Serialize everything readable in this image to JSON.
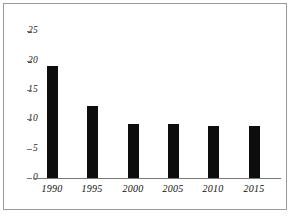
{
  "chart_data": {
    "type": "bar",
    "title": "",
    "subtitle": "",
    "xlabel": "",
    "ylabel": "",
    "categories": [
      "1990",
      "1995",
      "2000",
      "2005",
      "2010",
      "2015"
    ],
    "values": [
      17.5,
      11.3,
      8.5,
      8.5,
      8.2,
      8.2
    ],
    "series": [
      {
        "name": "",
        "values": [
          17.5,
          11.3,
          8.5,
          8.5,
          8.2,
          8.2
        ]
      }
    ],
    "ylim": [
      0,
      25
    ],
    "yticks": [
      0,
      5,
      10,
      15,
      20,
      25
    ],
    "ytick_labels": [
      "0",
      "5",
      "10",
      "15",
      "20",
      "25"
    ],
    "xtick_labels": [
      "1990",
      "1995",
      "2000",
      "2005",
      "2010",
      "2015"
    ],
    "grid": false,
    "legend": false,
    "legend_position": "none",
    "bar_color": "#0d0d0d",
    "axis_color": "#777777",
    "frame_color": "#9a9a9a",
    "background_color": "#ffffff",
    "annotations": []
  }
}
